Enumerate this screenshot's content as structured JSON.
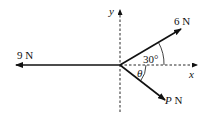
{
  "diagram": {
    "type": "force-diagram",
    "axes": {
      "x_label": "x",
      "y_label": "y",
      "style": "dashed"
    },
    "forces": [
      {
        "name": "force-9N",
        "label": "9 N",
        "direction": "negative x-axis"
      },
      {
        "name": "force-6N",
        "label": "6 N",
        "angle_label": "30°",
        "direction": "30° above positive x-axis"
      },
      {
        "name": "force-PN",
        "label_var": "P",
        "label_unit": " N",
        "angle_label": "θ",
        "direction": "θ below positive x-axis"
      }
    ]
  },
  "labels": {
    "y_axis": "y",
    "x_axis": "x",
    "force_9": "9 N",
    "force_6": "6 N",
    "force_p_var": "P",
    "force_p_unit": " N",
    "angle_30": "30°",
    "angle_theta": "θ"
  },
  "colors": {
    "stroke": "#111111",
    "background": "#ffffff"
  }
}
